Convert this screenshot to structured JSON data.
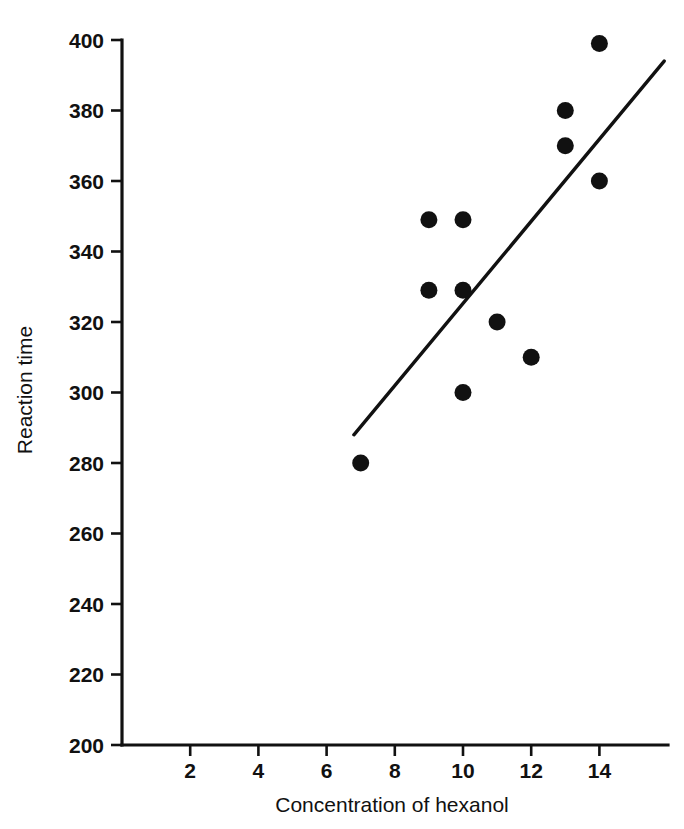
{
  "chart_data": {
    "type": "scatter",
    "title": "",
    "xlabel": "Concentration of hexanol",
    "ylabel": "Reaction time",
    "xlim": [
      0,
      15.8
    ],
    "ylim": [
      200,
      400
    ],
    "grid": false,
    "legend": "none",
    "xticks": [
      "2",
      "4",
      "6",
      "8",
      "10",
      "12",
      "14"
    ],
    "xtick_values": [
      2,
      4,
      6,
      8,
      10,
      12,
      14
    ],
    "yticks": [
      "200",
      "220",
      "240",
      "260",
      "280",
      "300",
      "320",
      "340",
      "360",
      "380",
      "400"
    ],
    "ytick_values": [
      200,
      220,
      240,
      260,
      280,
      300,
      320,
      340,
      360,
      380,
      400
    ],
    "x": [
      7,
      9,
      9,
      10,
      10,
      10,
      11,
      12,
      13,
      13,
      14,
      14
    ],
    "y": [
      280,
      349,
      329,
      349,
      329,
      300,
      320,
      310,
      380,
      370,
      399,
      360
    ],
    "points": [
      {
        "x": 7,
        "y": 280
      },
      {
        "x": 9,
        "y": 349
      },
      {
        "x": 9,
        "y": 329
      },
      {
        "x": 10,
        "y": 349
      },
      {
        "x": 10,
        "y": 329
      },
      {
        "x": 10,
        "y": 300
      },
      {
        "x": 11,
        "y": 320
      },
      {
        "x": 12,
        "y": 310
      },
      {
        "x": 13,
        "y": 380
      },
      {
        "x": 13,
        "y": 370
      },
      {
        "x": 14,
        "y": 399
      },
      {
        "x": 14,
        "y": 360
      }
    ],
    "trend_line": {
      "label": "fitted regression line",
      "x_start": 6.8,
      "y_start": 288,
      "x_end": 15.9,
      "y_end": 394
    },
    "marker": "filled-circle",
    "marker_color": "#111111",
    "line_color": "#111111",
    "background_color": "#ffffff"
  }
}
